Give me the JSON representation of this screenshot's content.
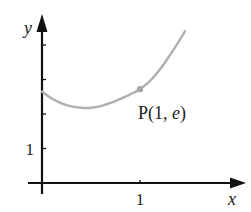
{
  "chart_data": {
    "type": "line",
    "title": "",
    "xlabel": "x",
    "ylabel": "y",
    "xlim": [
      -0.15,
      2.1
    ],
    "ylim": [
      -0.25,
      4.85
    ],
    "x_ticks": [
      1
    ],
    "x_tick_labels": [
      "1"
    ],
    "y_ticks": [
      1,
      2,
      3,
      4
    ],
    "y_tick_labels": [
      "1",
      "",
      "",
      ""
    ],
    "grid": false,
    "series": [
      {
        "name": "curve",
        "color": "#b0b0b0",
        "x": [
          0,
          0.1,
          0.2,
          0.3,
          0.4,
          0.5,
          0.6,
          0.7,
          0.8,
          0.9,
          1.0,
          1.1,
          1.2,
          1.3,
          1.4,
          1.46
        ],
        "y": [
          2.65,
          2.45,
          2.31,
          2.22,
          2.18,
          2.18,
          2.23,
          2.32,
          2.44,
          2.57,
          2.72,
          2.95,
          3.28,
          3.68,
          4.12,
          4.4
        ]
      }
    ],
    "annotations": [
      {
        "label": "P(1, e)",
        "x": 1,
        "y": 2.72,
        "marker": true
      }
    ]
  }
}
